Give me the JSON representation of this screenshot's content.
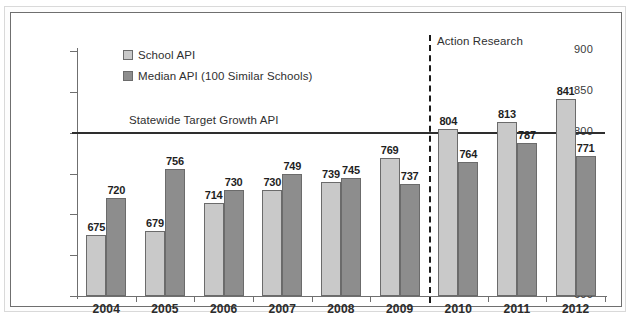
{
  "chart_data": {
    "type": "bar",
    "title": "",
    "xlabel": "",
    "ylabel": "",
    "ylim": [
      600,
      900
    ],
    "ytick_step": 50,
    "yticks": [
      900,
      850,
      800,
      750,
      700,
      650,
      600
    ],
    "grid": false,
    "legend_position": "top-left",
    "categories": [
      "2004",
      "2005",
      "2006",
      "2007",
      "2008",
      "2009",
      "2010",
      "2011",
      "2012"
    ],
    "series": [
      {
        "name": "School API",
        "color": "#c9c9c9",
        "values": [
          675,
          679,
          714,
          730,
          739,
          769,
          804,
          813,
          841
        ]
      },
      {
        "name": "Median API (100 Similar Schools)",
        "color": "#8d8d8d",
        "values": [
          720,
          756,
          730,
          749,
          745,
          737,
          764,
          787,
          771
        ]
      }
    ],
    "reference_line": {
      "value": 800,
      "label": "Statewide Target Growth API",
      "color": "#2e2e2e"
    },
    "annotations": [
      {
        "type": "vertical-dashed-divider",
        "label": "Action Research",
        "between": [
          "2009",
          "2010"
        ],
        "color": "#1a1a1a"
      }
    ]
  },
  "legend": {
    "items": [
      {
        "label": "School API",
        "swatch": "light"
      },
      {
        "label": "Median API (100 Similar Schools)",
        "swatch": "dark"
      }
    ]
  }
}
